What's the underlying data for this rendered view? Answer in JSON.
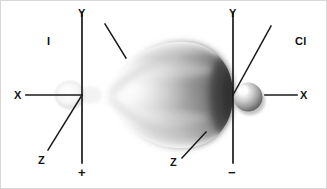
{
  "figure": {
    "kind": "orbital-overlap-diagram",
    "background_color": "#ffffff",
    "width": 327,
    "height": 189
  },
  "atoms": [
    {
      "id": "iodine",
      "label": "I",
      "label_x": 47,
      "label_y": 36,
      "origin_x": 82,
      "origin_y": 95
    },
    {
      "id": "chlorine",
      "label": "Cl",
      "label_x": 295,
      "label_y": 36,
      "origin_x": 233,
      "origin_y": 95
    }
  ],
  "axes": [
    {
      "system": "left",
      "origin_x": 82,
      "origin_y": 95,
      "y_label": "Y",
      "y_label_x": 78,
      "y_label_y": 8,
      "x_label": "X",
      "x_label_x": 14,
      "x_label_y": 90,
      "z_label": "Z",
      "z_label_x": 38,
      "z_label_y": 155,
      "sign": "+",
      "sign_x": 78,
      "sign_y": 168
    },
    {
      "system": "right",
      "origin_x": 233,
      "origin_y": 95,
      "y_label": "Y",
      "y_label_x": 229,
      "y_label_y": 8,
      "x_label": "X",
      "x_label_x": 300,
      "x_label_y": 90,
      "z_label": "Z",
      "z_label_x": 170,
      "z_label_y": 157,
      "sign": "−",
      "sign_x": 229,
      "sign_y": 168
    }
  ],
  "orbitals": [
    {
      "id": "iodine-small-lobe",
      "shape": "faint-small-lobe",
      "center_x": 70,
      "center_y": 95,
      "radius_x": 14,
      "radius_y": 13,
      "tone": "very-light-gray"
    },
    {
      "id": "iodine-large-lobe",
      "shape": "large-teardrop",
      "tip_x": 110,
      "tip_y": 95,
      "base_x": 233,
      "base_y": 95,
      "half_height": 53,
      "tone": "graded-gray"
    },
    {
      "id": "chlorine-sphere",
      "shape": "shaded-sphere",
      "center_x": 248,
      "center_y": 97,
      "radius": 15,
      "highlight_x": 243,
      "highlight_y": 91,
      "tone": "gray-with-highlight"
    }
  ],
  "colors": {
    "axis_line": "#1a1a1a",
    "text": "#111111",
    "lobe_dark": "#4a4a4a",
    "lobe_mid": "#9a9a9a",
    "lobe_light": "#e6e6e6",
    "sphere_highlight": "#f2f2f2",
    "sphere_shadow": "#5a5a5a",
    "background": "#ffffff",
    "frame": "#d8d8d8"
  }
}
